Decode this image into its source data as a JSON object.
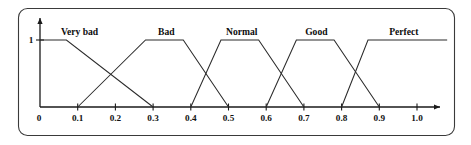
{
  "figure": {
    "title": "",
    "caption": ""
  },
  "chart_data": {
    "type": "line",
    "title": "",
    "subtitle": "",
    "xlabel": "",
    "ylabel": "",
    "xlim": [
      0.0,
      1.08
    ],
    "ylim": [
      0.0,
      1.0
    ],
    "grid": false,
    "legend_position": "inline-above-plateau",
    "x_ticks": [
      "0",
      "0.1",
      "0.2",
      "0.3",
      "0.4",
      "0.5",
      "0.6",
      "0.7",
      "0.8",
      "0.9",
      "1.0"
    ],
    "x_tick_values": [
      0.0,
      0.1,
      0.2,
      0.3,
      0.4,
      0.5,
      0.6,
      0.7,
      0.8,
      0.9,
      1.0
    ],
    "y_ticks": [
      "1"
    ],
    "y_tick_values": [
      1.0
    ],
    "origin_label": "0",
    "y_axis_top_label": "1",
    "x_axis_has_arrow": true,
    "y_axis_has_arrow": true,
    "membership_sets": [
      {
        "name": "Very bad",
        "shape": "trapezoid",
        "points": [
          [
            0.0,
            1.0
          ],
          [
            0.07,
            1.0
          ],
          [
            0.3,
            0.0
          ]
        ],
        "label_x": 0.105,
        "label_y": 1.0
      },
      {
        "name": "Bad",
        "shape": "trapezoid",
        "points": [
          [
            0.1,
            0.0
          ],
          [
            0.28,
            1.0
          ],
          [
            0.38,
            1.0
          ],
          [
            0.5,
            0.0
          ]
        ],
        "label_x": 0.335,
        "label_y": 1.0
      },
      {
        "name": "Normal",
        "shape": "trapezoid",
        "points": [
          [
            0.4,
            0.0
          ],
          [
            0.48,
            1.0
          ],
          [
            0.58,
            1.0
          ],
          [
            0.7,
            0.0
          ]
        ],
        "label_x": 0.535,
        "label_y": 1.0
      },
      {
        "name": "Good",
        "shape": "trapezoid",
        "points": [
          [
            0.6,
            0.0
          ],
          [
            0.68,
            1.0
          ],
          [
            0.78,
            1.0
          ],
          [
            0.9,
            0.0
          ]
        ],
        "label_x": 0.733,
        "label_y": 1.0
      },
      {
        "name": "Perfect",
        "shape": "trapezoid",
        "points": [
          [
            0.8,
            0.0
          ],
          [
            0.87,
            1.0
          ],
          [
            1.08,
            1.0
          ]
        ],
        "label_x": 0.965,
        "label_y": 1.0
      }
    ],
    "series": [
      {
        "name": "Very bad",
        "x": [
          0.0,
          0.07,
          0.3
        ],
        "values": [
          1.0,
          1.0,
          0.0
        ]
      },
      {
        "name": "Bad",
        "x": [
          0.1,
          0.28,
          0.38,
          0.5
        ],
        "values": [
          0.0,
          1.0,
          1.0,
          0.0
        ]
      },
      {
        "name": "Normal",
        "x": [
          0.4,
          0.48,
          0.58,
          0.7
        ],
        "values": [
          0.0,
          1.0,
          1.0,
          0.0
        ]
      },
      {
        "name": "Good",
        "x": [
          0.6,
          0.68,
          0.78,
          0.9
        ],
        "values": [
          0.0,
          1.0,
          1.0,
          0.0
        ]
      },
      {
        "name": "Perfect",
        "x": [
          0.8,
          0.87,
          1.08
        ],
        "values": [
          0.0,
          1.0,
          1.0
        ]
      }
    ]
  },
  "style": {
    "line_color": "#2b2b2b",
    "axis_color": "#1a1a1a",
    "frame_color": "#3a3a3a",
    "background": "#ffffff",
    "text_color": "#111111"
  }
}
